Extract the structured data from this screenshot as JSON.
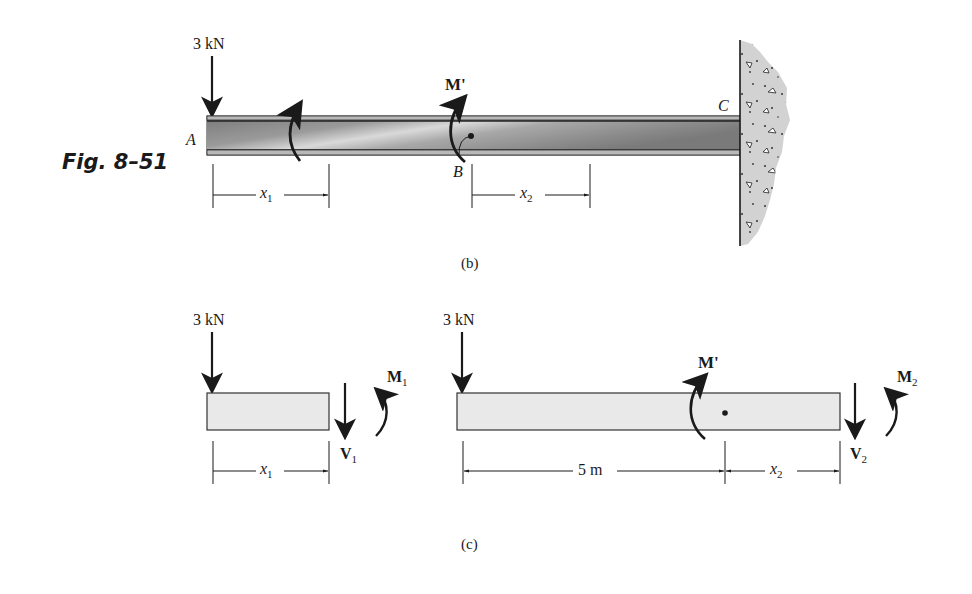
{
  "figure": {
    "label": "Fig. 8–51",
    "part_b": {
      "caption": "(b)",
      "load": "3 kN",
      "moment": "M'",
      "points": {
        "A": "A",
        "B": "B",
        "C": "C"
      },
      "dim_x1": {
        "var": "x",
        "sub": "1"
      },
      "dim_x2": {
        "var": "x",
        "sub": "2"
      },
      "support": "fixed-wall"
    },
    "part_c": {
      "caption": "(c)",
      "left_segment": {
        "load": "3 kN",
        "shear": {
          "var": "V",
          "sub": "1"
        },
        "moment": {
          "var": "M",
          "sub": "1"
        },
        "dim": {
          "var": "x",
          "sub": "1"
        }
      },
      "right_segment": {
        "load": "3 kN",
        "applied_moment": "M'",
        "shear": {
          "var": "V",
          "sub": "2"
        },
        "moment": {
          "var": "M",
          "sub": "2"
        },
        "dim_fixed": "5 m",
        "dim": {
          "var": "x",
          "sub": "2"
        }
      }
    }
  },
  "colors": {
    "ink": "#1a1a1a",
    "beam_dark": "#7a7a7a",
    "beam_light": "#d8d8d8",
    "fbd_fill": "#e9e9e9",
    "wall_fill": "#d4d4d4"
  }
}
